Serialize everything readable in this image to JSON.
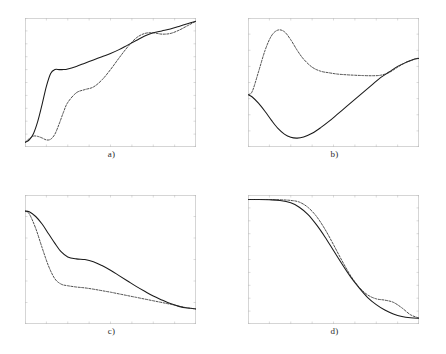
{
  "figure": {
    "panels": [
      {
        "id": "a",
        "label": "a)",
        "xlim": [
          0,
          800
        ],
        "ylim": [
          0,
          1
        ],
        "xticks": [
          "0",
          "100",
          "200",
          "300",
          "400",
          "500",
          "600",
          "700",
          "800"
        ],
        "yticks": [
          "0",
          "0.1",
          "0.2",
          "0.3",
          "0.4",
          "0.5",
          "0.6",
          "0.7",
          "0.8",
          "0.9",
          "1"
        ],
        "series": [
          {
            "name": "solid",
            "style": "solid",
            "x": [
              0,
              20,
              40,
              60,
              80,
              100,
              120,
              140,
              160,
              180,
              200,
              240,
              280,
              320,
              360,
              400,
              440,
              480,
              520,
              560,
              600,
              640,
              680,
              720,
              760,
              800
            ],
            "y": [
              0.035,
              0.055,
              0.105,
              0.2,
              0.33,
              0.47,
              0.57,
              0.6,
              0.6,
              0.6,
              0.605,
              0.625,
              0.65,
              0.675,
              0.7,
              0.725,
              0.755,
              0.79,
              0.825,
              0.86,
              0.885,
              0.9,
              0.915,
              0.935,
              0.955,
              0.975
            ]
          },
          {
            "name": "dashed",
            "style": "dashed",
            "x": [
              0,
              20,
              40,
              60,
              80,
              100,
              120,
              140,
              160,
              180,
              200,
              240,
              280,
              320,
              360,
              400,
              440,
              480,
              520,
              560,
              600,
              640,
              680,
              720,
              760,
              800
            ],
            "y": [
              0.035,
              0.065,
              0.085,
              0.082,
              0.07,
              0.055,
              0.06,
              0.1,
              0.18,
              0.27,
              0.345,
              0.42,
              0.445,
              0.465,
              0.52,
              0.6,
              0.69,
              0.775,
              0.845,
              0.88,
              0.885,
              0.875,
              0.88,
              0.905,
              0.94,
              0.975
            ]
          }
        ]
      },
      {
        "id": "b",
        "label": "b)",
        "xlim": [
          0,
          800
        ],
        "ylim": [
          0,
          0.8
        ],
        "xticks": [
          "0",
          "100",
          "200",
          "300",
          "400",
          "500",
          "600",
          "700",
          "800"
        ],
        "yticks": [
          "0",
          "0.1",
          "0.2",
          "0.3",
          "0.4",
          "0.5",
          "0.6",
          "0.7",
          "0.8"
        ],
        "series": [
          {
            "name": "solid",
            "style": "solid",
            "x": [
              0,
              20,
              50,
              80,
              110,
              140,
              170,
              200,
              230,
              260,
              300,
              340,
              380,
              420,
              460,
              500,
              540,
              580,
              620,
              660,
              700,
              740,
              780,
              800
            ],
            "y": [
              0.325,
              0.31,
              0.27,
              0.22,
              0.165,
              0.115,
              0.08,
              0.06,
              0.055,
              0.062,
              0.085,
              0.12,
              0.16,
              0.205,
              0.25,
              0.295,
              0.34,
              0.385,
              0.43,
              0.465,
              0.5,
              0.525,
              0.545,
              0.55
            ]
          },
          {
            "name": "dashed",
            "style": "dashed",
            "x": [
              0,
              20,
              50,
              80,
              110,
              140,
              170,
              200,
              230,
              260,
              300,
              340,
              380,
              420,
              460,
              500,
              540,
              580,
              620,
              660,
              700,
              740,
              780,
              800
            ],
            "y": [
              0.325,
              0.345,
              0.47,
              0.6,
              0.69,
              0.725,
              0.715,
              0.665,
              0.6,
              0.545,
              0.495,
              0.47,
              0.46,
              0.452,
              0.448,
              0.445,
              0.443,
              0.442,
              0.445,
              0.462,
              0.495,
              0.525,
              0.545,
              0.552
            ]
          }
        ]
      },
      {
        "id": "c",
        "label": "c)",
        "xlim": [
          0,
          800
        ],
        "ylim": [
          0,
          0.6
        ],
        "xticks": [
          "0",
          "100",
          "200",
          "300",
          "400",
          "500",
          "600",
          "700",
          "800"
        ],
        "yticks": [
          "0",
          "0.1",
          "0.2",
          "0.3",
          "0.4",
          "0.5",
          "0.6"
        ],
        "series": [
          {
            "name": "solid",
            "style": "solid",
            "x": [
              0,
              20,
              50,
              80,
              110,
              140,
              170,
              200,
              240,
              280,
              320,
              360,
              400,
              440,
              480,
              520,
              560,
              600,
              640,
              680,
              720,
              760,
              800
            ],
            "y": [
              0.525,
              0.522,
              0.5,
              0.465,
              0.42,
              0.375,
              0.335,
              0.312,
              0.303,
              0.3,
              0.29,
              0.272,
              0.25,
              0.225,
              0.2,
              0.175,
              0.152,
              0.13,
              0.112,
              0.095,
              0.082,
              0.074,
              0.07
            ]
          },
          {
            "name": "dashed",
            "style": "dashed",
            "x": [
              0,
              20,
              50,
              80,
              110,
              140,
              170,
              200,
              240,
              280,
              320,
              360,
              400,
              440,
              480,
              520,
              560,
              600,
              640,
              680,
              720,
              760,
              800
            ],
            "y": [
              0.525,
              0.512,
              0.445,
              0.355,
              0.27,
              0.21,
              0.185,
              0.178,
              0.172,
              0.168,
              0.162,
              0.155,
              0.148,
              0.14,
              0.132,
              0.124,
              0.116,
              0.108,
              0.1,
              0.092,
              0.083,
              0.075,
              0.07
            ]
          }
        ]
      },
      {
        "id": "d",
        "label": "d)",
        "xlim": [
          0,
          800
        ],
        "ylim": [
          0,
          1
        ],
        "xticks": [
          "0",
          "100",
          "200",
          "300",
          "400",
          "500",
          "600",
          "700",
          "800"
        ],
        "yticks": [
          "0",
          "0.1",
          "0.2",
          "0.3",
          "0.4",
          "0.5",
          "0.6",
          "0.7",
          "0.8",
          "0.9",
          "1"
        ],
        "series": [
          {
            "name": "solid",
            "style": "solid",
            "x": [
              0,
              50,
              100,
              150,
              200,
              240,
              280,
              320,
              360,
              400,
              440,
              480,
              520,
              560,
              600,
              640,
              680,
              720,
              760,
              800
            ],
            "y": [
              0.965,
              0.965,
              0.963,
              0.958,
              0.94,
              0.905,
              0.85,
              0.77,
              0.675,
              0.57,
              0.465,
              0.365,
              0.28,
              0.205,
              0.15,
              0.108,
              0.078,
              0.058,
              0.048,
              0.044
            ]
          },
          {
            "name": "dashed",
            "style": "dashed",
            "x": [
              0,
              50,
              100,
              150,
              200,
              240,
              280,
              320,
              360,
              400,
              440,
              480,
              520,
              560,
              600,
              640,
              680,
              720,
              760,
              800
            ],
            "y": [
              0.965,
              0.965,
              0.965,
              0.963,
              0.958,
              0.945,
              0.905,
              0.835,
              0.735,
              0.615,
              0.49,
              0.375,
              0.285,
              0.225,
              0.195,
              0.185,
              0.168,
              0.125,
              0.072,
              0.046
            ]
          }
        ]
      }
    ]
  },
  "colors": {
    "axis": "#b9b9b9",
    "tick_label": "#a8a8a8",
    "solid_curve": "#1a1a1a",
    "dashed_curve": "#2e2e2e",
    "panel_label": "#2b2b2b",
    "background": "#ffffff"
  },
  "chart_data": [
    {
      "type": "line",
      "title": "a)",
      "xlabel": "",
      "ylabel": "",
      "xlim": [
        0,
        800
      ],
      "ylim": [
        0,
        1
      ],
      "grid": false,
      "legend": "none",
      "categories": [
        0,
        20,
        40,
        60,
        80,
        100,
        120,
        140,
        160,
        180,
        200,
        240,
        280,
        320,
        360,
        400,
        440,
        480,
        520,
        560,
        600,
        640,
        680,
        720,
        760,
        800
      ],
      "series": [
        {
          "name": "solid",
          "linestyle": "solid",
          "values": [
            0.035,
            0.055,
            0.105,
            0.2,
            0.33,
            0.47,
            0.57,
            0.6,
            0.6,
            0.6,
            0.605,
            0.625,
            0.65,
            0.675,
            0.7,
            0.725,
            0.755,
            0.79,
            0.825,
            0.86,
            0.885,
            0.9,
            0.915,
            0.935,
            0.955,
            0.975
          ]
        },
        {
          "name": "dashed",
          "linestyle": "dashed",
          "values": [
            0.035,
            0.065,
            0.085,
            0.082,
            0.07,
            0.055,
            0.06,
            0.1,
            0.18,
            0.27,
            0.345,
            0.42,
            0.445,
            0.465,
            0.52,
            0.6,
            0.69,
            0.775,
            0.845,
            0.88,
            0.885,
            0.875,
            0.88,
            0.905,
            0.94,
            0.975
          ]
        }
      ]
    },
    {
      "type": "line",
      "title": "b)",
      "xlabel": "",
      "ylabel": "",
      "xlim": [
        0,
        800
      ],
      "ylim": [
        0,
        0.8
      ],
      "grid": false,
      "legend": "none",
      "categories": [
        0,
        20,
        50,
        80,
        110,
        140,
        170,
        200,
        230,
        260,
        300,
        340,
        380,
        420,
        460,
        500,
        540,
        580,
        620,
        660,
        700,
        740,
        780,
        800
      ],
      "series": [
        {
          "name": "solid",
          "linestyle": "solid",
          "values": [
            0.325,
            0.31,
            0.27,
            0.22,
            0.165,
            0.115,
            0.08,
            0.06,
            0.055,
            0.062,
            0.085,
            0.12,
            0.16,
            0.205,
            0.25,
            0.295,
            0.34,
            0.385,
            0.43,
            0.465,
            0.5,
            0.525,
            0.545,
            0.55
          ]
        },
        {
          "name": "dashed",
          "linestyle": "dashed",
          "values": [
            0.325,
            0.345,
            0.47,
            0.6,
            0.69,
            0.725,
            0.715,
            0.665,
            0.6,
            0.545,
            0.495,
            0.47,
            0.46,
            0.452,
            0.448,
            0.445,
            0.443,
            0.442,
            0.445,
            0.462,
            0.495,
            0.525,
            0.545,
            0.552
          ]
        }
      ]
    },
    {
      "type": "line",
      "title": "c)",
      "xlabel": "",
      "ylabel": "",
      "xlim": [
        0,
        800
      ],
      "ylim": [
        0,
        0.6
      ],
      "grid": false,
      "legend": "none",
      "categories": [
        0,
        20,
        50,
        80,
        110,
        140,
        170,
        200,
        240,
        280,
        320,
        360,
        400,
        440,
        480,
        520,
        560,
        600,
        640,
        680,
        720,
        760,
        800
      ],
      "series": [
        {
          "name": "solid",
          "linestyle": "solid",
          "values": [
            0.525,
            0.522,
            0.5,
            0.465,
            0.42,
            0.375,
            0.335,
            0.312,
            0.303,
            0.3,
            0.29,
            0.272,
            0.25,
            0.225,
            0.2,
            0.175,
            0.152,
            0.13,
            0.112,
            0.095,
            0.082,
            0.074,
            0.07
          ]
        },
        {
          "name": "dashed",
          "linestyle": "dashed",
          "values": [
            0.525,
            0.512,
            0.445,
            0.355,
            0.27,
            0.21,
            0.185,
            0.178,
            0.172,
            0.168,
            0.162,
            0.155,
            0.148,
            0.14,
            0.132,
            0.124,
            0.116,
            0.108,
            0.1,
            0.092,
            0.083,
            0.075,
            0.07
          ]
        }
      ]
    },
    {
      "type": "line",
      "title": "d)",
      "xlabel": "",
      "ylabel": "",
      "xlim": [
        0,
        800
      ],
      "ylim": [
        0,
        1
      ],
      "grid": false,
      "legend": "none",
      "categories": [
        0,
        50,
        100,
        150,
        200,
        240,
        280,
        320,
        360,
        400,
        440,
        480,
        520,
        560,
        600,
        640,
        680,
        720,
        760,
        800
      ],
      "series": [
        {
          "name": "solid",
          "linestyle": "solid",
          "values": [
            0.965,
            0.965,
            0.963,
            0.958,
            0.94,
            0.905,
            0.85,
            0.77,
            0.675,
            0.57,
            0.465,
            0.365,
            0.28,
            0.205,
            0.15,
            0.108,
            0.078,
            0.058,
            0.048,
            0.044
          ]
        },
        {
          "name": "dashed",
          "linestyle": "dashed",
          "values": [
            0.965,
            0.965,
            0.965,
            0.963,
            0.958,
            0.945,
            0.905,
            0.835,
            0.735,
            0.615,
            0.49,
            0.375,
            0.285,
            0.225,
            0.195,
            0.185,
            0.168,
            0.125,
            0.072,
            0.046
          ]
        }
      ]
    }
  ]
}
